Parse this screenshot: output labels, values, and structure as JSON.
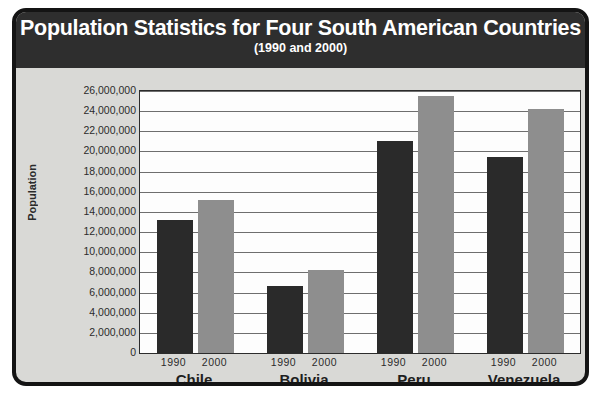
{
  "chart_data": {
    "type": "bar",
    "title": "Population Statistics for Four South American Countries",
    "subtitle": "(1990 and 2000)",
    "xlabel": "",
    "ylabel": "Population",
    "categories": [
      "Chile",
      "Bolivia",
      "Peru",
      "Venezuela"
    ],
    "series": [
      {
        "name": "1990",
        "color": "#2a2a2a",
        "values": [
          13200000,
          6700000,
          21000000,
          19500000
        ]
      },
      {
        "name": "2000",
        "color": "#8e8e8e",
        "values": [
          15200000,
          8200000,
          25500000,
          24200000
        ]
      }
    ],
    "ylim": [
      0,
      26000000
    ],
    "ytick_step": 2000000,
    "ytick_labels": [
      "26,000,000",
      "24,000,000",
      "22,000,000",
      "20,000,000",
      "18,000,000",
      "16,000,000",
      "14,000,000",
      "12,000,000",
      "10,000,000",
      "8,000,000",
      "6,000,000",
      "4,000,000",
      "2,000,000",
      "0"
    ],
    "ytick_values": [
      26000000,
      24000000,
      22000000,
      20000000,
      18000000,
      16000000,
      14000000,
      12000000,
      10000000,
      8000000,
      6000000,
      4000000,
      2000000,
      0
    ],
    "grid": true,
    "legend": "none",
    "group_year_labels": [
      "1990",
      "2000"
    ]
  },
  "colors": {
    "frame_border": "#141414",
    "frame_background": "#d9d9d6",
    "banner_background": "#2e2e2e",
    "banner_text": "#ffffff",
    "plot_background": "#fdfdfd",
    "gridline": "#6e6e6e",
    "axis_text": "#2b2b2b",
    "bar_1990": "#2a2a2a",
    "bar_2000": "#8e8e8e"
  }
}
